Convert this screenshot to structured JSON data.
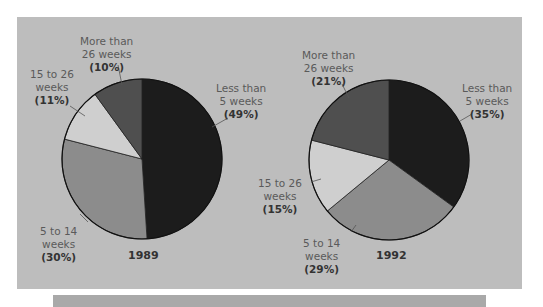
{
  "chart_data": [
    {
      "type": "pie",
      "title": "1989",
      "categories": [
        "Less than 5 weeks",
        "5 to 14 weeks",
        "15 to 26 weeks",
        "More than 26 weeks"
      ],
      "values": [
        49,
        30,
        11,
        10
      ],
      "unit": "%",
      "colors": [
        "#1c1c1c",
        "#8c8c8c",
        "#cfcfcf",
        "#4f4f4f"
      ]
    },
    {
      "type": "pie",
      "title": "1992",
      "categories": [
        "Less than 5 weeks",
        "5 to 14 weeks",
        "15 to 26 weeks",
        "More than 26 weeks"
      ],
      "values": [
        35,
        29,
        15,
        21
      ],
      "unit": "%",
      "colors": [
        "#1c1c1c",
        "#8c8c8c",
        "#cfcfcf",
        "#4f4f4f"
      ]
    }
  ],
  "pie1989": {
    "year": "1989",
    "labels": {
      "less5": {
        "line1": "Less than",
        "line2": "5 weeks",
        "pct": "(49%)"
      },
      "w5to14": {
        "line1": "5 to 14",
        "line2": "weeks",
        "pct": "(30%)"
      },
      "w15to26": {
        "line1": "15 to 26",
        "line2": "weeks",
        "pct": "(11%)"
      },
      "more26": {
        "line1": "More than",
        "line2": "26 weeks",
        "pct": "(10%)"
      }
    }
  },
  "pie1992": {
    "year": "1992",
    "labels": {
      "less5": {
        "line1": "Less than",
        "line2": "5 weeks",
        "pct": "(35%)"
      },
      "w5to14": {
        "line1": "5 to 14",
        "line2": "weeks",
        "pct": "(29%)"
      },
      "w15to26": {
        "line1": "15 to 26",
        "line2": "weeks",
        "pct": "(15%)"
      },
      "more26": {
        "line1": "More than",
        "line2": "26 weeks",
        "pct": "(21%)"
      }
    }
  }
}
